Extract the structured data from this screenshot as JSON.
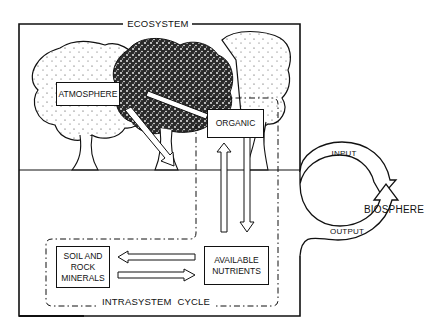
{
  "diagram": {
    "ecosystem_label": "ECOSYSTEM",
    "intrasystem_label": "INTRASYSTEM  CYCLE",
    "biosphere_label": "BIOSPHERE",
    "input_label": "INPUT",
    "output_label": "OUTPUT",
    "nodes": {
      "atmosphere": "ATMOSPHERE",
      "organic": "ORGANIC",
      "soil_line1": "SOIL AND",
      "soil_line2": "ROCK",
      "soil_line3": "MINERALS",
      "nutrients_line1": "AVAILABLE",
      "nutrients_line2": "NUTRIENTS"
    },
    "edges": [
      {
        "from": "ATMOSPHERE",
        "to": "ORGANIC",
        "type": "double-line"
      },
      {
        "from": "ATMOSPHERE",
        "to": "ground/soil",
        "type": "hollow-arrow"
      },
      {
        "from": "ORGANIC",
        "to": "AVAILABLE NUTRIENTS",
        "type": "hollow-arrow"
      },
      {
        "from": "AVAILABLE NUTRIENTS",
        "to": "ORGANIC",
        "type": "hollow-arrow"
      },
      {
        "from": "AVAILABLE NUTRIENTS",
        "to": "SOIL AND ROCK MINERALS",
        "type": "hollow-arrow"
      },
      {
        "from": "SOIL AND ROCK MINERALS",
        "to": "AVAILABLE NUTRIENTS",
        "type": "hollow-arrow"
      },
      {
        "from": "BIOSPHERE",
        "to": "ECOSYSTEM",
        "label": "INPUT",
        "type": "curved-arrow"
      },
      {
        "from": "ECOSYSTEM",
        "to": "BIOSPHERE",
        "label": "OUTPUT",
        "type": "curved-arrow"
      }
    ],
    "colors": {
      "ink": "#111111",
      "paper": "#ffffff"
    }
  }
}
